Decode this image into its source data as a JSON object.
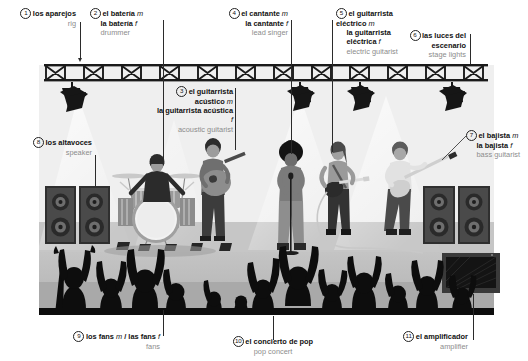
{
  "palette": {
    "ink": "#111111",
    "english_gray": "#8c8c8c",
    "leader_line": "#2b2b2b",
    "panel_bg": "#f2f2f2",
    "stage_floor": "#b9b9b9",
    "crowd_floor": "#a8a8a8",
    "silhouette": "#111111",
    "truss": "#1a1a1a",
    "speaker_dark": "#3a3a3a",
    "skin_mid": "#9a9a9a",
    "highlight": "#ffffff"
  },
  "labels": [
    {
      "num": "1",
      "spanish": "los aparejos",
      "gender": "",
      "spanish2": "",
      "gender2": "",
      "english": "rig",
      "align": "right"
    },
    {
      "num": "2",
      "spanish": "el batería",
      "gender": "m",
      "spanish2": "la batería",
      "gender2": "f",
      "english": "drummer",
      "align": "left"
    },
    {
      "num": "3",
      "spanish": "el guitarrista acústico",
      "gender": "m",
      "spanish2": "la guitarrista acústica",
      "gender2": "f",
      "english": "acoustic guitarist",
      "align": "right"
    },
    {
      "num": "4",
      "spanish": "el cantante",
      "gender": "m",
      "spanish2": "la cantante",
      "gender2": "f",
      "english": "lead singer",
      "align": "right"
    },
    {
      "num": "5",
      "spanish": "el guitarrista eléctrico",
      "gender": "m",
      "spanish2": "la guitarrista eléctrica",
      "gender2": "f",
      "english": "electric guitarist",
      "align": "left"
    },
    {
      "num": "6",
      "spanish": "las luces del escenario",
      "gender": "",
      "spanish2": "",
      "gender2": "",
      "english": "stage lights",
      "align": "right"
    },
    {
      "num": "7",
      "spanish": "el bajista",
      "gender": "m",
      "spanish2": "la bajista",
      "gender2": "f",
      "english": "bass guitarist",
      "align": "left"
    },
    {
      "num": "8",
      "spanish": "los altavoces",
      "gender": "",
      "spanish2": "",
      "gender2": "",
      "english": "speaker",
      "align": "right"
    },
    {
      "num": "9",
      "spanish": "los fans",
      "gender": "m",
      "spanish2": "las fans",
      "gender2": "f",
      "english": "fans",
      "align": "right",
      "separator": "/"
    },
    {
      "num": "10",
      "spanish": "el concierto de pop",
      "gender": "",
      "spanish2": "",
      "gender2": "",
      "english": "pop concert",
      "align": "center"
    },
    {
      "num": "11",
      "spanish": "el amplificador",
      "gender": "",
      "spanish2": "",
      "gender2": "",
      "english": "amplifier",
      "align": "right"
    }
  ],
  "scene": {
    "description": "Pop concert stage: lighting truss with 4 stage lights, drummer behind kit, acoustic guitarist, lead singer at microphone, electric guitarist, bass guitarist, two speaker stacks, one amplifier, crowd of fan silhouettes with raised hands in foreground.",
    "performer_count": 5,
    "stage_light_count": 4,
    "speaker_stack_count": 2,
    "amplifier_count": 1
  }
}
